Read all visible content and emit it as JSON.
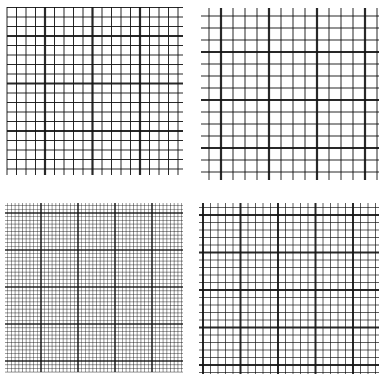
{
  "image": {
    "width": 386,
    "height": 378,
    "background": "#ffffff",
    "line_color": "#111111",
    "description": "Four graph-paper grid samples with different minor/major spacings"
  },
  "panels": [
    {
      "name": "grid-top-left",
      "x0": 7,
      "y0": 7,
      "x1": 183,
      "y1": 175,
      "minor_spacing": 9.5,
      "major_every": 5,
      "major_offset_x": 45,
      "major_offset_y": 36,
      "minor_width": 1,
      "major_width": 2.2
    },
    {
      "name": "grid-top-right",
      "x0": 201,
      "y0": 8,
      "x1": 379,
      "y1": 180,
      "minor_spacing": 12,
      "major_every": 4,
      "major_offset_x": 221,
      "major_offset_y": 52,
      "minor_width": 1,
      "major_width": 2.2
    },
    {
      "name": "grid-bottom-left",
      "x0": 5,
      "y0": 203,
      "x1": 183,
      "y1": 372,
      "minor_spacing": 3.7,
      "major_every": 10,
      "major_offset_x": 41,
      "major_offset_y": 213,
      "minor_width": 0.6,
      "major_width": 1.6
    },
    {
      "name": "grid-bottom-right",
      "x0": 199,
      "y0": 203,
      "x1": 379,
      "y1": 374,
      "minor_spacing": 7.5,
      "major_every": 5,
      "major_offset_x": 203,
      "major_offset_y": 215,
      "minor_width": 0.9,
      "major_width": 2
    }
  ]
}
